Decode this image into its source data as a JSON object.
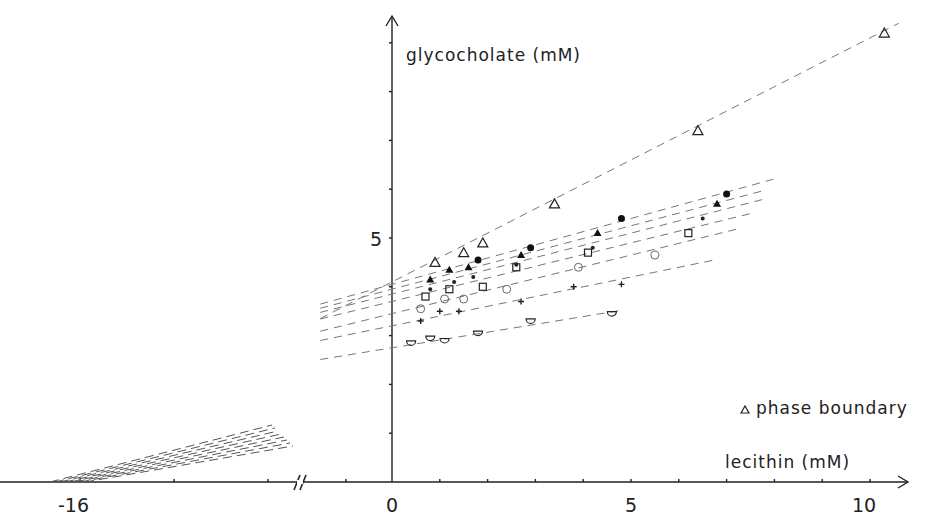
{
  "chart_data": {
    "type": "scatter",
    "title": "",
    "xlabel": "lecithin (mM)",
    "ylabel": "glycocholate (mM)",
    "x_ticks": [
      "-16",
      "0",
      "5",
      "10"
    ],
    "y_ticks": [
      "5"
    ],
    "xlim": [
      -17,
      10.5
    ],
    "ylim": [
      0,
      9.5
    ],
    "axis_break": "//",
    "grid": false,
    "legend": [
      {
        "marker": "triangle-open",
        "label": "phase boundary"
      }
    ],
    "series": [
      {
        "name": "phase boundary",
        "marker": "triangle-open",
        "x": [
          0.9,
          1.5,
          1.9,
          3.4,
          6.4,
          10.3
        ],
        "y": [
          4.5,
          4.7,
          4.9,
          5.7,
          7.2,
          9.2
        ],
        "fit": {
          "intercept": 4.1,
          "slope": 0.5
        }
      },
      {
        "name": "series-filled-circle",
        "marker": "circle-filled",
        "x": [
          1.8,
          2.9,
          4.8,
          7.0
        ],
        "y": [
          4.55,
          4.8,
          5.4,
          5.9
        ],
        "fit": {
          "intercept": 4.05,
          "slope": 0.27
        }
      },
      {
        "name": "series-filled-triangle",
        "marker": "triangle-filled",
        "x": [
          0.8,
          1.2,
          1.6,
          2.7,
          4.3,
          6.8
        ],
        "y": [
          4.15,
          4.35,
          4.4,
          4.65,
          5.1,
          5.7
        ],
        "fit": {
          "intercept": 3.95,
          "slope": 0.26
        }
      },
      {
        "name": "series-small-dot",
        "marker": "dot",
        "x": [
          0.8,
          1.3,
          1.7,
          2.6,
          4.2,
          6.5
        ],
        "y": [
          3.95,
          4.1,
          4.2,
          4.45,
          4.8,
          5.4
        ],
        "fit": {
          "intercept": 3.85,
          "slope": 0.25
        }
      },
      {
        "name": "series-open-square",
        "marker": "square-open",
        "x": [
          0.7,
          1.2,
          1.9,
          2.6,
          4.1,
          6.2
        ],
        "y": [
          3.8,
          3.95,
          4.0,
          4.4,
          4.7,
          5.1
        ],
        "fit": {
          "intercept": 3.7,
          "slope": 0.24
        }
      },
      {
        "name": "series-open-circle",
        "marker": "circle-open",
        "x": [
          0.6,
          1.1,
          1.5,
          2.4,
          3.9,
          5.5
        ],
        "y": [
          3.55,
          3.75,
          3.75,
          3.95,
          4.4,
          4.65
        ],
        "fit": {
          "intercept": 3.45,
          "slope": 0.24
        }
      },
      {
        "name": "series-plus",
        "marker": "plus",
        "x": [
          0.6,
          1.0,
          1.4,
          2.7,
          3.8,
          4.8
        ],
        "y": [
          3.3,
          3.5,
          3.5,
          3.7,
          4.0,
          4.05
        ],
        "fit": {
          "intercept": 3.2,
          "slope": 0.2
        }
      },
      {
        "name": "series-half-circle",
        "marker": "half-circle-open",
        "x": [
          0.4,
          0.8,
          1.1,
          1.8,
          2.9,
          4.6
        ],
        "y": [
          2.85,
          2.95,
          2.9,
          3.05,
          3.3,
          3.45
        ],
        "fit": {
          "intercept": 2.75,
          "slope": 0.16
        }
      }
    ],
    "annotations": [
      "phase boundary"
    ]
  },
  "labels": {
    "ylabel": "glycocholate  (mM)",
    "xlabel": "lecithin  (mM)",
    "legend": "phase boundary",
    "tick_m16": "-16",
    "tick_0": "0",
    "tick_5x": "5",
    "tick_10": "10",
    "tick_5y": "5",
    "break": "//"
  }
}
